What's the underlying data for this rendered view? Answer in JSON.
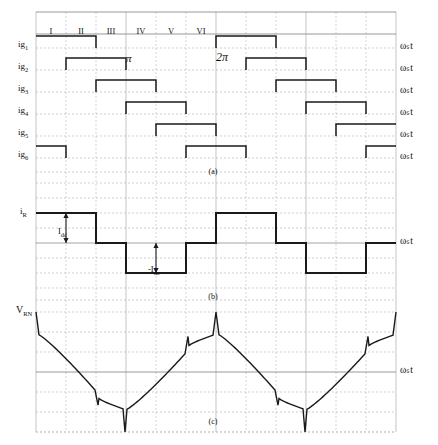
{
  "figure": {
    "axis_label": "ωₛt",
    "colors": {
      "grid": "#b9b9b9",
      "grid_major": "#8d8d8d",
      "trace": "#1a1a1a",
      "background": "#ffffff"
    },
    "plot_area": {
      "x0": 36,
      "x1": 396,
      "top": 12,
      "bottom": 432
    }
  },
  "intervals": {
    "labels": [
      "I",
      "II",
      "III",
      "IV",
      "V",
      "VI"
    ],
    "y": 26,
    "centers": [
      51,
      81,
      111,
      141,
      171,
      201
    ]
  },
  "markers": [
    {
      "name": "pi",
      "text": "π",
      "x": 126,
      "y": 52,
      "size": "large"
    },
    {
      "name": "two-pi",
      "text": "2π",
      "x": 216,
      "y": 50,
      "size": "xlarge"
    }
  ],
  "panels": [
    {
      "id": "a",
      "caption": "(a)",
      "caption_x": 213,
      "caption_y": 167
    },
    {
      "id": "b",
      "caption": "(b)",
      "caption_y": 292,
      "caption_x": 213
    },
    {
      "id": "c",
      "caption": "(c)",
      "caption_y": 417,
      "caption_x": 213
    }
  ],
  "gate_signals": {
    "labels": [
      "ig",
      "ig",
      "ig",
      "ig",
      "ig",
      "ig"
    ],
    "subscripts": [
      "1",
      "2",
      "3",
      "4",
      "5",
      "6"
    ],
    "label_x": 18,
    "baselines": [
      48,
      70,
      92,
      114,
      136,
      158
    ],
    "height": 12,
    "axis_labels": [
      "ωₛt",
      "ωₛt",
      "ωₛt",
      "ωₛt",
      "ωₛt",
      "ωₛt"
    ],
    "axis_label_x": 400,
    "pulses": [
      [
        [
          36,
          96
        ],
        [
          216,
          276
        ]
      ],
      [
        [
          66,
          126
        ],
        [
          246,
          306
        ]
      ],
      [
        [
          96,
          156
        ],
        [
          276,
          336
        ]
      ],
      [
        [
          126,
          186
        ],
        [
          306,
          366
        ]
      ],
      [
        [
          156,
          216
        ],
        [
          336,
          396
        ]
      ],
      [
        [
          36,
          66
        ],
        [
          186,
          246
        ],
        [
          366,
          396
        ]
      ]
    ]
  },
  "current_waveform": {
    "label": "i",
    "label_subscript": "R",
    "label_x": 20,
    "label_y": 206,
    "axis_label": "ωₛt",
    "axis_label_x": 400,
    "axis_label_y": 243,
    "zero_y": 243,
    "high_y": 213,
    "low_y": 273,
    "annotations": [
      {
        "name": "idc-positive",
        "text": "I",
        "subscript": "dc",
        "x": 58,
        "y": 226
      },
      {
        "name": "idc-negative",
        "text": "-I",
        "subscript": "dc",
        "x": 148,
        "y": 264
      }
    ],
    "levels": [
      {
        "x0": 36,
        "x1": 66,
        "level": 1
      },
      {
        "x0": 66,
        "x1": 96,
        "level": 1
      },
      {
        "x0": 96,
        "x1": 126,
        "level": 0
      },
      {
        "x0": 126,
        "x1": 156,
        "level": -1
      },
      {
        "x0": 156,
        "x1": 186,
        "level": -1
      },
      {
        "x0": 186,
        "x1": 216,
        "level": 0
      },
      {
        "x0": 216,
        "x1": 276,
        "level": 1
      },
      {
        "x0": 276,
        "x1": 306,
        "level": 0
      },
      {
        "x0": 306,
        "x1": 366,
        "level": -1
      },
      {
        "x0": 366,
        "x1": 396,
        "level": 0
      }
    ]
  },
  "voltage_waveform": {
    "label": "V",
    "label_subscript": "RN",
    "label_x": 16,
    "label_y": 312,
    "axis_label": "ωₛt",
    "axis_label_x": 400,
    "axis_label_y": 372,
    "zero_y": 372,
    "peak_y": 312,
    "trough_y": 432,
    "period_px": 180,
    "description": "Phase voltage with 2/3 Vdc and 1/3 Vdc steps plus commutation spikes"
  },
  "grid": {
    "vertical_step": 30,
    "vertical_count": 13,
    "horizontal_lines_a": [
      12,
      34,
      48,
      70,
      92,
      114,
      136,
      158,
      172
    ],
    "horizontal_lines_b": [
      183,
      198,
      213,
      228,
      243,
      258,
      273,
      288
    ],
    "horizontal_lines_c": [
      300,
      312,
      332,
      352,
      372,
      392,
      412,
      432
    ]
  }
}
